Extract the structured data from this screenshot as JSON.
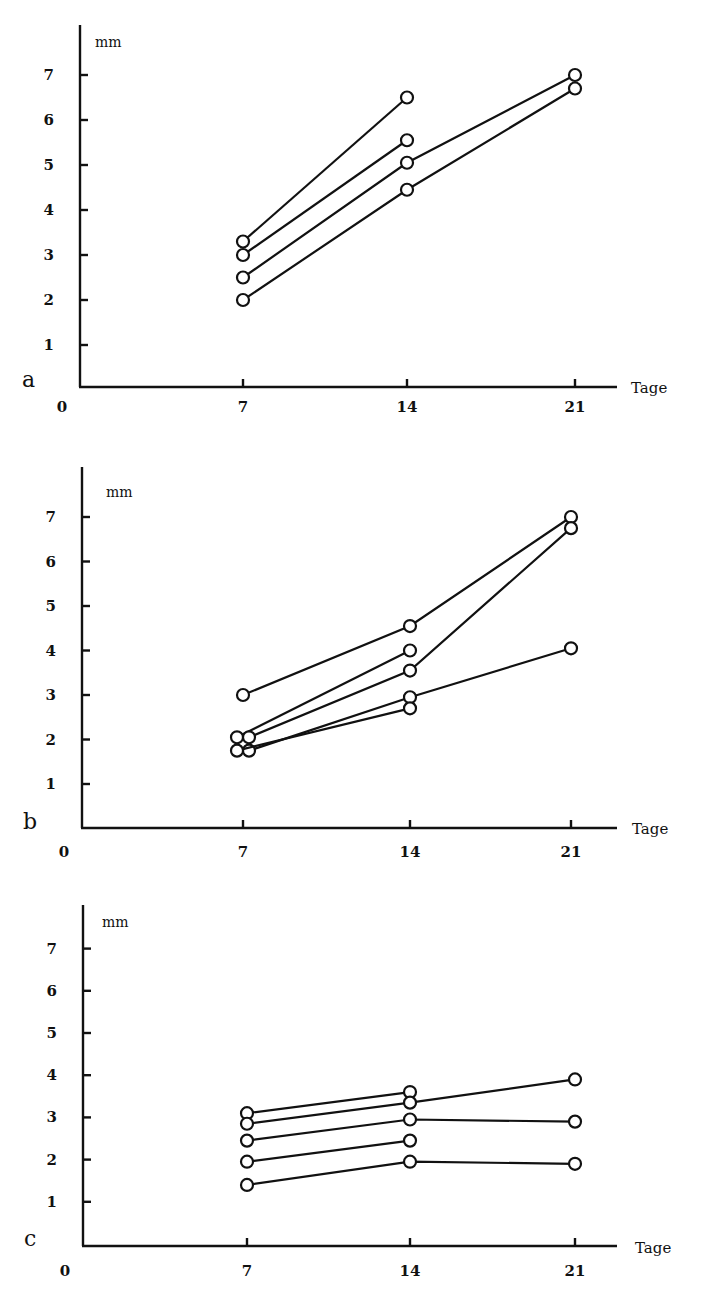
{
  "figure": {
    "x_unit_label": "Tage",
    "y_unit_label": "mm"
  },
  "chart_data": [
    {
      "panel": "a",
      "type": "line",
      "title": "",
      "xlabel": "Tage",
      "ylabel": "mm",
      "x_ticks": [
        0,
        7,
        14,
        21
      ],
      "y_ticks": [
        1,
        2,
        3,
        4,
        5,
        6,
        7
      ],
      "xlim": [
        0,
        23
      ],
      "ylim": [
        0,
        8
      ],
      "grid": false,
      "legend": null,
      "marker": "open-circle",
      "series": [
        {
          "name": "a1",
          "x": [
            7,
            14
          ],
          "y": [
            3.3,
            6.5
          ]
        },
        {
          "name": "a2",
          "x": [
            7,
            14
          ],
          "y": [
            3.0,
            5.55
          ]
        },
        {
          "name": "a3",
          "x": [
            7,
            14,
            21
          ],
          "y": [
            2.5,
            5.05,
            7.0
          ]
        },
        {
          "name": "a4",
          "x": [
            7,
            14,
            21
          ],
          "y": [
            2.0,
            4.45,
            6.7
          ]
        }
      ]
    },
    {
      "panel": "b",
      "type": "line",
      "title": "",
      "xlabel": "Tage",
      "ylabel": "mm",
      "x_ticks": [
        0,
        7,
        14,
        21
      ],
      "y_ticks": [
        1,
        2,
        3,
        4,
        5,
        6,
        7
      ],
      "xlim": [
        0,
        23
      ],
      "ylim": [
        0,
        8
      ],
      "grid": false,
      "legend": null,
      "marker": "open-circle",
      "series": [
        {
          "name": "b1",
          "x": [
            7,
            14,
            21
          ],
          "y": [
            3.0,
            4.55,
            7.0
          ]
        },
        {
          "name": "b2",
          "x": [
            7,
            14
          ],
          "y": [
            2.05,
            4.0
          ],
          "x_offset_day7": -0.25
        },
        {
          "name": "b3",
          "x": [
            7,
            14,
            21
          ],
          "y": [
            2.05,
            3.55,
            6.75
          ],
          "x_offset_day7": 0.25
        },
        {
          "name": "b4",
          "x": [
            7,
            14,
            21
          ],
          "y": [
            1.75,
            2.95,
            4.05
          ],
          "x_offset_day7": 0.25
        },
        {
          "name": "b5",
          "x": [
            7,
            14
          ],
          "y": [
            1.75,
            2.7
          ],
          "x_offset_day7": -0.25
        }
      ]
    },
    {
      "panel": "c",
      "type": "line",
      "title": "",
      "xlabel": "Tage",
      "ylabel": "mm",
      "x_ticks": [
        0,
        7,
        14,
        21
      ],
      "y_ticks": [
        1,
        2,
        3,
        4,
        5,
        6,
        7
      ],
      "xlim": [
        0,
        23
      ],
      "ylim": [
        0,
        8
      ],
      "grid": false,
      "legend": null,
      "marker": "open-circle",
      "series": [
        {
          "name": "c1",
          "x": [
            7,
            14
          ],
          "y": [
            3.1,
            3.6
          ]
        },
        {
          "name": "c2",
          "x": [
            7,
            14,
            21
          ],
          "y": [
            2.85,
            3.35,
            3.9
          ]
        },
        {
          "name": "c3",
          "x": [
            7,
            14,
            21
          ],
          "y": [
            2.45,
            2.95,
            2.9
          ]
        },
        {
          "name": "c4",
          "x": [
            7,
            14
          ],
          "y": [
            1.95,
            2.45
          ]
        },
        {
          "name": "c5",
          "x": [
            7,
            14,
            21
          ],
          "y": [
            1.4,
            1.95,
            1.9
          ]
        }
      ]
    }
  ],
  "layout": {
    "panels": [
      {
        "x_px": {
          "0": 80,
          "7": 243,
          "14": 407,
          "21": 575
        },
        "y0_px": 390,
        "unit_px": 45,
        "axis_top": 25,
        "baseline": 387,
        "axis_right": 617,
        "letter_xy": [
          22,
          387
        ],
        "mm_xy": [
          95,
          47
        ],
        "tage_xy": [
          631,
          393
        ],
        "xtick_label_y": 412
      },
      {
        "x_px": {
          "0": 82,
          "7": 243,
          "14": 410,
          "21": 571
        },
        "y0_px": 828.5,
        "unit_px": 44.5,
        "axis_top": 467,
        "baseline": 828,
        "axis_right": 617,
        "letter_xy": [
          23,
          829
        ],
        "mm_xy": [
          106,
          497
        ],
        "tage_xy": [
          632,
          834
        ],
        "xtick_label_y": 857
      },
      {
        "x_px": {
          "0": 83,
          "7": 247,
          "14": 410,
          "21": 575
        },
        "y0_px": 1244,
        "unit_px": 42.2,
        "axis_top": 905,
        "baseline": 1246,
        "axis_right": 617,
        "letter_xy": [
          24,
          1246
        ],
        "mm_xy": [
          102,
          927
        ],
        "tage_xy": [
          635,
          1253
        ],
        "xtick_label_y": 1276
      }
    ],
    "day7_offset_px": 6
  }
}
